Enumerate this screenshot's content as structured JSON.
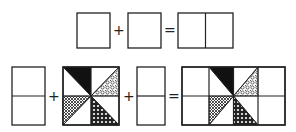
{
  "diagram": {
    "row1": {
      "equation": [
        "square",
        "+",
        "square",
        "=",
        "two-square rectangle"
      ],
      "operators": {
        "plus": "+",
        "equals": "="
      }
    },
    "row2": {
      "equation": [
        "two-square column",
        "+",
        "pinwheel block",
        "+",
        "two-square column",
        "=",
        "assembled block with side columns"
      ],
      "operators": {
        "plus1": "+",
        "plus2": "+",
        "equals": "="
      }
    },
    "pinwheel": {
      "patches": [
        {
          "position": "top-left",
          "fill": "solid-black"
        },
        {
          "position": "top-right",
          "fill": "swirl-pattern"
        },
        {
          "position": "bottom-left",
          "fill": "crosshatch"
        },
        {
          "position": "bottom-right",
          "fill": "dots"
        }
      ]
    },
    "colors": {
      "line": "#222222",
      "background": "#ffffff",
      "solid": "#111111"
    }
  }
}
